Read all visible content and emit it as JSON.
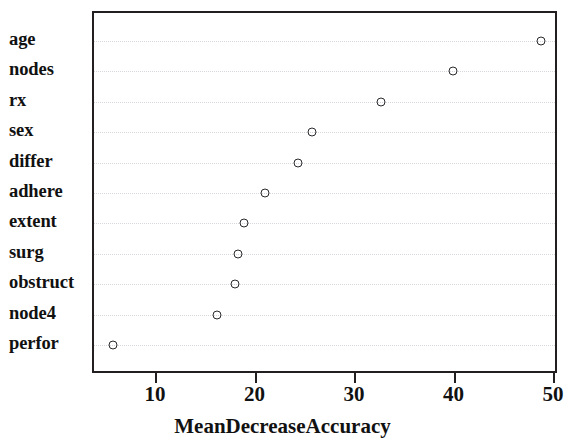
{
  "chart_data": {
    "type": "scatter",
    "title": "",
    "subtitle": "",
    "xlabel": "MeanDecreaseAccuracy",
    "ylabel": "",
    "xlim": [
      5.0,
      50.3
    ],
    "ylim": [
      0,
      12
    ],
    "grid": true,
    "grid_orientation": "horizontal",
    "legend": false,
    "legend_position": "none",
    "marker": "open-circle",
    "marker_color": "#2a2a2e",
    "categories": [
      "age",
      "nodes",
      "rx",
      "sex",
      "differ",
      "adhere",
      "extent",
      "surg",
      "obstruct",
      "node4",
      "perfor"
    ],
    "values": [
      48.6,
      39.7,
      32.5,
      25.6,
      24.2,
      20.9,
      18.7,
      18.1,
      17.8,
      16.0,
      5.6
    ],
    "points": [
      {
        "label": "age",
        "value": 48.6
      },
      {
        "label": "nodes",
        "value": 39.7
      },
      {
        "label": "rx",
        "value": 32.5
      },
      {
        "label": "sex",
        "value": 25.6
      },
      {
        "label": "differ",
        "value": 24.2
      },
      {
        "label": "adhere",
        "value": 20.9
      },
      {
        "label": "extent",
        "value": 18.7
      },
      {
        "label": "surg",
        "value": 18.1
      },
      {
        "label": "obstruct",
        "value": 17.8
      },
      {
        "label": "node4",
        "value": 16.0
      },
      {
        "label": "perfor",
        "value": 5.6
      }
    ],
    "x_ticks": [
      10,
      20,
      30,
      40,
      50
    ],
    "x_tick_labels": [
      "10",
      "20",
      "30",
      "40",
      "50"
    ],
    "y_tick_labels": [
      "age",
      "nodes",
      "rx",
      "sex",
      "differ",
      "adhere",
      "extent",
      "surg",
      "obstruct",
      "node4",
      "perfor"
    ],
    "colors": {
      "axis": "#231f20",
      "grid": "#d8d8dc",
      "text": "#111111",
      "background": "#ffffff"
    }
  }
}
